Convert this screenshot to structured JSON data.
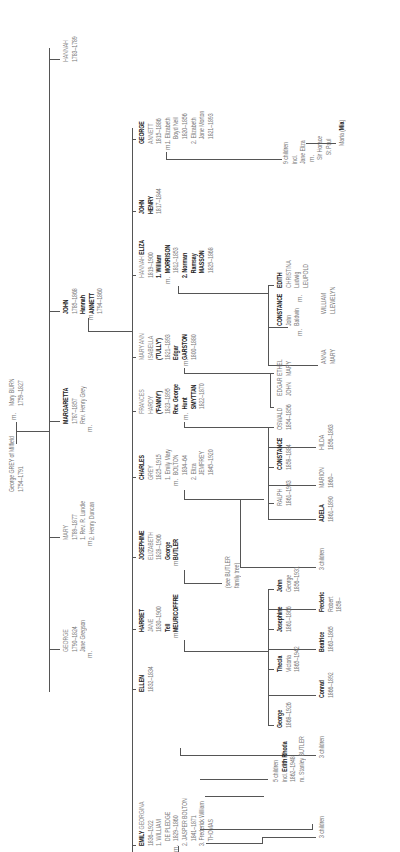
{
  "marriage_label": "m.",
  "gen0": {
    "father": {
      "name": "George GREY of Milfield",
      "dates": "1754–1791"
    },
    "mother": {
      "name": "Mary BURN",
      "dates": "1759–1827"
    }
  },
  "gen1": [
    {
      "name": "HANNAH",
      "dates": "1783–1789"
    },
    {
      "name": "JOHN",
      "dates": "1785–1868",
      "spouse_first": "Hannah",
      "spouse_last": "ANNETT",
      "spouse_dates": "1794–1860"
    },
    {
      "name": "MARGARETTA",
      "dates": "1787–1857",
      "spouse": "Rev. Henry Grey"
    },
    {
      "name": "MARY",
      "dates": "1789–1877",
      "spouse1": "1. Rev. R. Lundie",
      "spouse2": "2. Henry Duncan"
    },
    {
      "name": "GEORGE",
      "dates": "1790–1824",
      "spouse": "Jane Gregson"
    }
  ],
  "gen2": [
    {
      "first": "GEORGE",
      "middle": "ANNETT",
      "dates": "1815–1886",
      "spouses": [
        "1. Elizabeth",
        "Boyd Neil",
        "1820–1856",
        "2. Elizabeth",
        "Jane Morton",
        "1821–1893"
      ]
    },
    {
      "first": "JOHN",
      "middle": "HENRY",
      "dates": "1817–1844"
    },
    {
      "first": "HANNAH",
      "bold": "ELIZA",
      "dates": "1819–1900",
      "spouses": [
        "1. William",
        "MORRISON",
        "1812–1853",
        "2. Norman",
        "Ramsay",
        "MASSON",
        "1825–1868"
      ]
    },
    {
      "first": "MARY ANN",
      "middle": "ISABELLA",
      "nick": "('TULLY')",
      "dates": "1821–1893",
      "spouse_first": "Edgar",
      "spouse_last": "GARSTON",
      "spouse_dates": "1800–1880"
    },
    {
      "first": "FRANCES",
      "middle": "HARDY",
      "nick": "('FANNY')",
      "dates": "1823–1895",
      "spouse_first": "Rev. George",
      "spouse_mid": "Hunt",
      "spouse_last": "SMYTTAN",
      "spouse_dates": "1822–1870"
    },
    {
      "first": "CHARLES",
      "middle": "GREY",
      "dates": "1825–1915",
      "spouses": [
        "1. Emily Mary",
        "BOLTON",
        "1834–64",
        "2. Eliza",
        "JEMFREY",
        "1845–1920"
      ]
    },
    {
      "first": "JOSEPHINE",
      "middle": "ELIZABETH",
      "dates": "1828–1906",
      "spouse_first": "George",
      "spouse_last": "BUTLER",
      "note1": "(see BUTLER",
      "note2": "family tree)"
    },
    {
      "first": "HARRIET",
      "middle": "JANE",
      "dates": "1830–1900",
      "spouse_first": "Tell",
      "spouse_last": "MEURICOFFRE"
    },
    {
      "first": "ELLEN",
      "dates": "1832–1834"
    },
    {
      "first": "EMILY",
      "rest": " GEORGINA",
      "dates": "1836–1922",
      "spouses": [
        "1. WILLIAM",
        "DE PLEDGE",
        "1829–1860",
        "2. JASPER BOLTON",
        "1841–1871",
        "3. Frederick William",
        "THOMAS"
      ]
    }
  ],
  "gen3": {
    "george_children": {
      "line1": "9 children",
      "line2": "incl.",
      "line3": "Jane Eliza",
      "spouse1": "Sir Horace",
      "spouse2": "St Paul",
      "grandchild_pre": "Maria (",
      "grandchild_bold": "Mia",
      "grandchild_post": ")"
    },
    "eliza_children": [
      {
        "first": "EDITH",
        "middle": "CHRISTINA",
        "spouse1": "Ludwig",
        "spouse2": "LEUPOLD"
      },
      {
        "first": "WILLIAM",
        "middle": "LLEWELYN"
      },
      {
        "first": "CONSTANCE",
        "spouse1": "John",
        "spouse2": "Baldwin"
      },
      {
        "first": "ANNA",
        "middle": "MARY"
      }
    ],
    "tully_children": [
      {
        "first": "ETHEL",
        "middle": "MARY"
      },
      {
        "first": "EDGAR",
        "middle": "JOHN"
      }
    ],
    "fanny_children": [
      {
        "first": "OSWALD",
        "dates": "1854–1856"
      },
      {
        "first": "HILDA",
        "dates": "1856–1863"
      },
      {
        "first": "CONSTANCE",
        "dates": "1858–1884"
      },
      {
        "first": "MARION",
        "dates": "1860–"
      },
      {
        "first": "RALPH",
        "dates": "1861–1943"
      },
      {
        "first": "ADELA",
        "dates": "1861–1890"
      }
    ],
    "charles_children": "3 children",
    "harriet_children": [
      {
        "first": "John",
        "middle": "George",
        "dates": "1856–1931"
      },
      {
        "first": "Frederic",
        "middle": "Robert",
        "dates": "1858–"
      },
      {
        "first": "Josephine",
        "dates": "1861–1866"
      },
      {
        "first": "Beatrice",
        "dates": "1863–1865"
      },
      {
        "first": "Thecla",
        "middle": "Victoria",
        "dates": "1865–1942"
      },
      {
        "first": "Conrad",
        "dates": "1866–1892"
      },
      {
        "first": "George",
        "dates": "1868–1926"
      }
    ],
    "emily_children_1": "3 children",
    "emily_children_2": {
      "line1": "5 children",
      "line2_pre": "incl. ",
      "line2_bold": "Edith Rhoda",
      "dates": "1862–1948",
      "spouse": "Stanley BUTLER"
    },
    "emily_children_3": "3 children"
  }
}
